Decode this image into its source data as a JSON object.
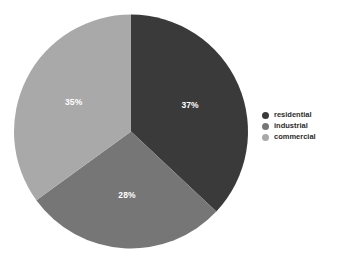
{
  "chart_data": {
    "type": "pie",
    "title": "",
    "categories": [
      "residential",
      "industrial",
      "commercial"
    ],
    "values": [
      37,
      28,
      35
    ],
    "labels": [
      "37%",
      "28%",
      "35%"
    ],
    "colors": [
      "#3a3a3a",
      "#767676",
      "#a9a9a9"
    ],
    "legend_position": "right",
    "grid": false,
    "background": "#ffffff",
    "label_color": "#ffffff",
    "start_angle_deg": 0,
    "direction": "clockwise",
    "slices": [
      {
        "name": "residential",
        "value": 37,
        "label": "37%",
        "color": "#3a3a3a"
      },
      {
        "name": "industrial",
        "value": 28,
        "label": "28%",
        "color": "#767676"
      },
      {
        "name": "commercial",
        "value": 35,
        "label": "35%",
        "color": "#a9a9a9"
      }
    ]
  },
  "legend": {
    "items": [
      {
        "label": "residential",
        "color": "#3a3a3a"
      },
      {
        "label": "industrial",
        "color": "#767676"
      },
      {
        "label": "commercial",
        "color": "#a9a9a9"
      }
    ]
  }
}
